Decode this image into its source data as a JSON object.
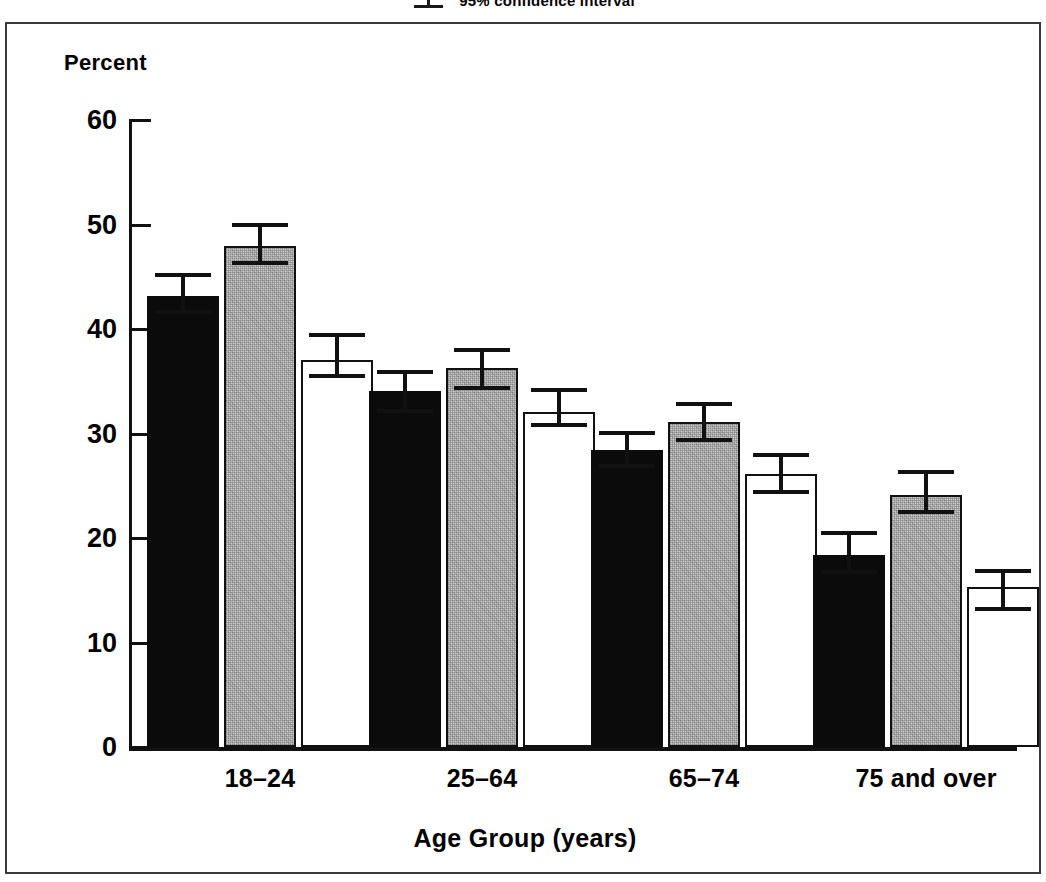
{
  "legend": {
    "label": "95% confidence interval",
    "symbol_icon": "error-bar-icon"
  },
  "axes": {
    "y_title": "Percent",
    "x_title": "Age Group (years)",
    "y_ticks": [
      "0",
      "10",
      "20",
      "30",
      "40",
      "50",
      "60"
    ],
    "y_min": 0,
    "y_max": 60
  },
  "chart_data": {
    "type": "bar",
    "title": "",
    "xlabel": "Age Group (years)",
    "ylabel": "Percent",
    "ylim": [
      0,
      60
    ],
    "yticks": [
      0,
      10,
      20,
      30,
      40,
      50,
      60
    ],
    "grid": false,
    "legend_position": "top-center",
    "error_bars": "95% confidence interval",
    "categories": [
      "18–24",
      "25–64",
      "65–74",
      "75 and over"
    ],
    "series": [
      {
        "name": "series-1-black",
        "style": "filled-black",
        "color": "#0b0b0b",
        "values": [
          43.2,
          34.1,
          28.4,
          18.4
        ],
        "ci_low": [
          41.4,
          32.0,
          26.7,
          16.6
        ],
        "ci_high": [
          45.4,
          36.1,
          30.2,
          20.7
        ]
      },
      {
        "name": "series-2-gray",
        "style": "stippled-gray",
        "color": "#cccccc",
        "values": [
          47.9,
          36.3,
          31.1,
          24.1
        ],
        "ci_low": [
          46.1,
          34.2,
          29.2,
          22.3
        ],
        "ci_high": [
          50.1,
          38.2,
          33.0,
          26.5
        ]
      },
      {
        "name": "series-3-white",
        "style": "open-white",
        "color": "#ffffff",
        "values": [
          37.0,
          32.1,
          26.1,
          15.3
        ],
        "ci_low": [
          35.3,
          30.6,
          24.2,
          13.0
        ],
        "ci_high": [
          39.6,
          34.4,
          28.1,
          17.0
        ]
      }
    ]
  }
}
